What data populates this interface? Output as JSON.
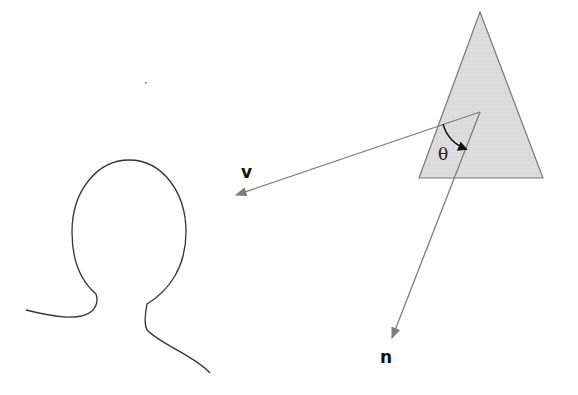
{
  "diagram": {
    "title": "",
    "labels": {
      "view_vector": "v",
      "normal_vector": "n",
      "angle": "θ"
    },
    "colors": {
      "triangle_fill": "#dcdcdc",
      "triangle_stroke": "#7a7a7a",
      "vector_stroke": "#7d7d7d",
      "arc_stroke": "#111111",
      "head_stroke": "#333333"
    },
    "elements": [
      {
        "id": "surface-triangle",
        "kind": "polygon",
        "points": [
          [
            480,
            12
          ],
          [
            419,
            178
          ],
          [
            543,
            178
          ]
        ]
      },
      {
        "id": "view-vector",
        "kind": "arrow",
        "from": [
          480,
          112
        ],
        "to": [
          233,
          196
        ],
        "label": "v"
      },
      {
        "id": "normal-vector",
        "kind": "arrow",
        "from": [
          480,
          112
        ],
        "to": [
          390,
          342
        ],
        "label": "n"
      },
      {
        "id": "angle-arc",
        "kind": "arc",
        "label": "θ"
      },
      {
        "id": "viewer-head",
        "kind": "outline"
      }
    ]
  }
}
